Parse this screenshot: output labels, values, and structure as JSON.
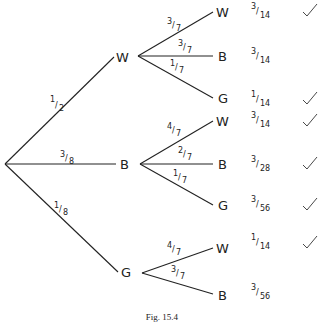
{
  "figure": {
    "caption": "Fig. 15.4",
    "root": {
      "branches": [
        {
          "prob": "1/2",
          "num": "1",
          "den": "2",
          "label": "W",
          "children": [
            {
              "prob": "3/7",
              "num": "3",
              "den": "7",
              "label": "W",
              "result_num": "3",
              "result_den": "14",
              "checked": true
            },
            {
              "prob": "3/7",
              "num": "3",
              "den": "7",
              "label": "B",
              "result_num": "3",
              "result_den": "14",
              "checked": false
            },
            {
              "prob": "1/7",
              "num": "1",
              "den": "7",
              "label": "G",
              "result_num": "1",
              "result_den": "14",
              "checked": true
            }
          ]
        },
        {
          "prob": "3/8",
          "num": "3",
          "den": "8",
          "label": "B",
          "children": [
            {
              "prob": "4/7",
              "num": "4",
              "den": "7",
              "label": "W",
              "result_num": "3",
              "result_den": "14",
              "checked": true
            },
            {
              "prob": "2/7",
              "num": "2",
              "den": "7",
              "label": "B",
              "result_num": "3",
              "result_den": "28",
              "checked": true
            },
            {
              "prob": "1/7",
              "num": "1",
              "den": "7",
              "label": "G",
              "result_num": "3",
              "result_den": "56",
              "checked": true
            }
          ]
        },
        {
          "prob": "1/8",
          "num": "1",
          "den": "8",
          "label": "G",
          "children": [
            {
              "prob": "4/7",
              "num": "4",
              "den": "7",
              "label": "W",
              "result_num": "1",
              "result_den": "14",
              "checked": true
            },
            {
              "prob": "3/7",
              "num": "3",
              "den": "7",
              "label": "B",
              "result_num": "3",
              "result_den": "56",
              "checked": false
            }
          ]
        }
      ]
    }
  }
}
